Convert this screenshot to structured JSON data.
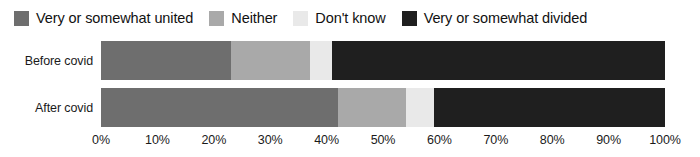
{
  "chart_data": {
    "type": "bar",
    "orientation": "horizontal",
    "stacked": true,
    "normalized": "100%",
    "title": "",
    "subtitle": "",
    "xlabel": "",
    "ylabel": "",
    "xlim": [
      0,
      100
    ],
    "grid": false,
    "legend_position": "top-left",
    "categories": [
      "Before covid",
      "After covid"
    ],
    "tick_labels": [
      "0%",
      "10%",
      "20%",
      "30%",
      "40%",
      "50%",
      "60%",
      "70%",
      "80%",
      "90%",
      "100%"
    ],
    "tick_values": [
      0,
      10,
      20,
      30,
      40,
      50,
      60,
      70,
      80,
      90,
      100
    ],
    "series": [
      {
        "name": "Very or somewhat united",
        "color": "#6e6e6e",
        "values": [
          23,
          42
        ]
      },
      {
        "name": "Neither",
        "color": "#a9a9a9",
        "values": [
          14,
          12
        ]
      },
      {
        "name": "Don't know",
        "color": "#e9e9e9",
        "values": [
          4,
          5
        ]
      },
      {
        "name": "Very or somewhat divided",
        "color": "#1f1f1f",
        "values": [
          59,
          41
        ]
      }
    ]
  },
  "legend": {
    "items": [
      {
        "label": "Very or somewhat united",
        "color": "#6e6e6e"
      },
      {
        "label": "Neither",
        "color": "#a9a9a9"
      },
      {
        "label": "Don't know",
        "color": "#e9e9e9"
      },
      {
        "label": "Very or somewhat divided",
        "color": "#1f1f1f"
      }
    ]
  },
  "rows": [
    {
      "label": "Before covid"
    },
    {
      "label": "After covid"
    }
  ],
  "axis": {
    "ticks": [
      {
        "label": "0%",
        "value": 0
      },
      {
        "label": "10%",
        "value": 10
      },
      {
        "label": "20%",
        "value": 20
      },
      {
        "label": "30%",
        "value": 30
      },
      {
        "label": "40%",
        "value": 40
      },
      {
        "label": "50%",
        "value": 50
      },
      {
        "label": "60%",
        "value": 60
      },
      {
        "label": "70%",
        "value": 70
      },
      {
        "label": "80%",
        "value": 80
      },
      {
        "label": "90%",
        "value": 90
      },
      {
        "label": "100%",
        "value": 100
      }
    ]
  }
}
